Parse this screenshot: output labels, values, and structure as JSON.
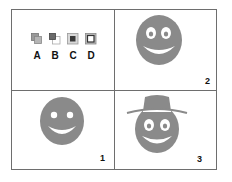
{
  "panels": {
    "top_left": {
      "icons": [
        {
          "label": "A",
          "icon": "overlap-squares-filled-icon"
        },
        {
          "label": "B",
          "icon": "overlap-squares-offset-icon"
        },
        {
          "label": "C",
          "icon": "square-inside-frame-icon"
        },
        {
          "label": "D",
          "icon": "square-inside-frame-outlined-icon"
        }
      ]
    },
    "top_right": {
      "number": "2",
      "figure": "smiley-face-oval-eyes"
    },
    "bottom_left": {
      "number": "1",
      "figure": "smiley-face-dot-eyes"
    },
    "bottom_right": {
      "number": "3",
      "figure": "smiley-face-with-hat"
    }
  },
  "colors": {
    "face": "#8a8a8a",
    "border": "#6e6e6e",
    "text": "#111111"
  }
}
